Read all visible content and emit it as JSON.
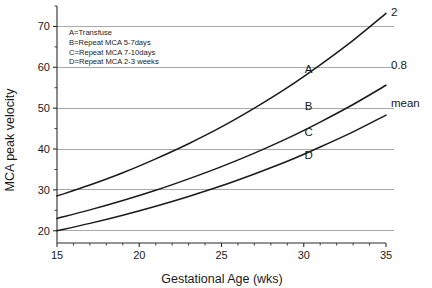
{
  "chart_data": {
    "type": "line",
    "title": "",
    "xlabel": "Gestational Age (wks)",
    "ylabel": "MCA peak velocity",
    "xlim": [
      15,
      35
    ],
    "ylim": [
      17,
      75
    ],
    "grid": true,
    "gridlines_y": [
      20,
      30,
      40,
      50,
      60,
      70
    ],
    "x_ticks": [
      15,
      20,
      25,
      30,
      35
    ],
    "x_tick_labels": [
      "15",
      "20",
      "25",
      "30",
      "35"
    ],
    "x_minor_tick_step": 1,
    "y_ticks": [
      20,
      30,
      40,
      50,
      60,
      70
    ],
    "y_tick_labels": [
      "20",
      "30",
      "40",
      "50",
      "60",
      "70"
    ],
    "legend_position": "upper-left-inset",
    "x": [
      15,
      17,
      19,
      21,
      23,
      25,
      27,
      29,
      31,
      33,
      35
    ],
    "series": [
      {
        "name": "2",
        "edge_label": "2",
        "curve_label": "A",
        "values": [
          28.5,
          31.2,
          34.2,
          37.6,
          41.3,
          45.4,
          50.0,
          55.0,
          60.6,
          66.6,
          73.2
        ]
      },
      {
        "name": "0.8",
        "edge_label": "0.8",
        "curve_label": "B",
        "values": [
          23.0,
          25.1,
          27.4,
          29.9,
          32.7,
          35.7,
          39.0,
          42.6,
          46.6,
          50.9,
          55.6
        ]
      },
      {
        "name": "mean",
        "edge_label": "mean",
        "curve_label": "C",
        "values": [
          20.0,
          21.8,
          23.8,
          26.0,
          28.4,
          31.0,
          33.9,
          37.0,
          40.5,
          44.2,
          48.3
        ]
      }
    ],
    "curve_labels": [
      {
        "text": "A",
        "x": 30.3,
        "y": 58.5
      },
      {
        "text": "B",
        "x": 30.3,
        "y": 49.5
      },
      {
        "text": "C",
        "x": 30.3,
        "y": 43.2
      },
      {
        "text": "D",
        "x": 30.3,
        "y": 37.5
      }
    ],
    "edge_labels": [
      {
        "text": "2",
        "x": 35,
        "y": 73.2
      },
      {
        "text": "0.8",
        "x": 35,
        "y": 60.2
      },
      {
        "text": "mean",
        "x": 35,
        "y": 51.0
      }
    ],
    "annotations": [
      "A=Transfuse",
      "B=Repeat MCA 5-7days",
      "C=Repeat MCA 7-10days",
      "D=Repeat MCA 2-3 weeks"
    ],
    "colors": {
      "curve": "#1a1a1a",
      "grid": "#a8a8a8",
      "axis": "#2b2b2b",
      "background": "#ffffff"
    }
  },
  "legend": {
    "items": [
      {
        "key": "A",
        "label": "A=Transfuse"
      },
      {
        "key": "B",
        "label": "B=Repeat MCA 5-7days"
      },
      {
        "key": "C",
        "label": "C=Repeat MCA 7-10days"
      },
      {
        "key": "D",
        "label": "D=Repeat MCA 2-3 weeks"
      }
    ]
  },
  "axes": {
    "x_title": "Gestational Age (wks)",
    "y_title": "MCA peak velocity"
  }
}
